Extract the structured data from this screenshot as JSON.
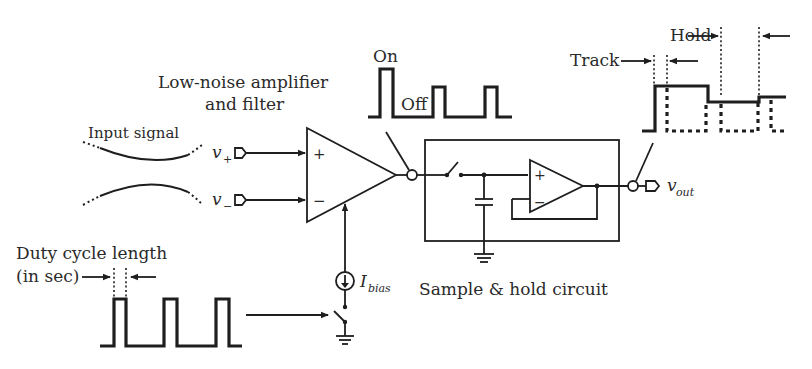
{
  "diagram": {
    "type": "circuit-block-diagram",
    "labels": {
      "amplifier_line1": "Low-noise amplifier",
      "amplifier_line2": "and filter",
      "input_signal": "Input signal",
      "v_plus": "v",
      "v_plus_sub": "+",
      "v_minus": "v",
      "v_minus_sub": "−",
      "on": "On",
      "off": "Off",
      "hold": "Hold",
      "track": "Track",
      "v_out": "v",
      "v_out_sub": "out",
      "i_bias": "I",
      "i_bias_sub": "bias",
      "duty_line1": "Duty cycle length",
      "duty_line2": "(in sec)",
      "sample_hold": "Sample & hold circuit",
      "amp_plus": "+",
      "amp_minus": "−",
      "buf_plus": "+",
      "buf_minus": "−"
    },
    "components": [
      {
        "id": "lna",
        "kind": "differential-amplifier",
        "inputs": [
          "v+",
          "v-"
        ],
        "bias": "Ibias"
      },
      {
        "id": "switch-power",
        "kind": "switch",
        "controlled_by": "duty-cycle-clock"
      },
      {
        "id": "current-source",
        "kind": "current-source",
        "label": "Ibias"
      },
      {
        "id": "sh-switch",
        "kind": "switch"
      },
      {
        "id": "sh-cap",
        "kind": "capacitor"
      },
      {
        "id": "sh-buffer",
        "kind": "unity-gain-buffer"
      },
      {
        "id": "out-switch",
        "kind": "switch"
      }
    ],
    "waveforms": {
      "duty_cycle_clock": {
        "pulses": 3
      },
      "amp_on_off": {
        "pulses": 3,
        "states": [
          "On",
          "Off"
        ]
      },
      "track_hold_output": {
        "phases": [
          "Track",
          "Hold"
        ]
      }
    },
    "colors": {
      "ink": "#1e1e1e",
      "text": "#2a2a2a",
      "background": "#ffffff"
    }
  }
}
